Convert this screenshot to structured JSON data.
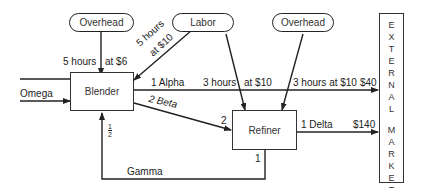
{
  "nodes": {
    "overhead_left": "Overhead",
    "labor": "Labor",
    "overhead_right": "Overhead",
    "blender": "Blender",
    "refiner": "Refiner",
    "market_letters": [
      "E",
      "X",
      "T",
      "E",
      "R",
      "N",
      "A",
      "L",
      "",
      "M",
      "A",
      "R",
      "K",
      "E",
      "T"
    ]
  },
  "labels": {
    "overhead_hours": "5 hours",
    "overhead_rate": "at $6",
    "labor_hours_line1": "5 hours",
    "labor_hours_line2": "at $10",
    "omega": "Omega",
    "alpha": "1 Alpha",
    "alpha_labor_hours": "3 hours",
    "alpha_labor_rate": "at $10",
    "alpha_overhead": "3 hours at $10",
    "alpha_price": "$40",
    "beta": "2 Beta",
    "beta_qty": "2",
    "delta": "1 Delta",
    "delta_price": "$140",
    "gamma": "Gamma",
    "gamma_qty": "1",
    "half_num": "1",
    "half_den": "2"
  }
}
